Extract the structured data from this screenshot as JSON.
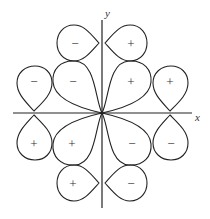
{
  "diagram": {
    "title": "",
    "axes": {
      "x_label": "x",
      "y_label": "y"
    },
    "lobes": [
      {
        "id": "top-left-small",
        "sign": "−"
      },
      {
        "id": "top-right-small",
        "sign": "+"
      },
      {
        "id": "outer-left-upper",
        "sign": "−"
      },
      {
        "id": "inner-left-upper",
        "sign": "−"
      },
      {
        "id": "inner-right-upper",
        "sign": "+"
      },
      {
        "id": "outer-right-upper",
        "sign": "+"
      },
      {
        "id": "outer-left-lower",
        "sign": "+"
      },
      {
        "id": "inner-left-lower",
        "sign": "+"
      },
      {
        "id": "inner-right-lower",
        "sign": "−"
      },
      {
        "id": "outer-right-lower",
        "sign": "−"
      },
      {
        "id": "bottom-left-small",
        "sign": "+"
      },
      {
        "id": "bottom-right-small",
        "sign": "−"
      }
    ],
    "colors": {
      "stroke": "#222222",
      "background": "#ffffff"
    }
  }
}
